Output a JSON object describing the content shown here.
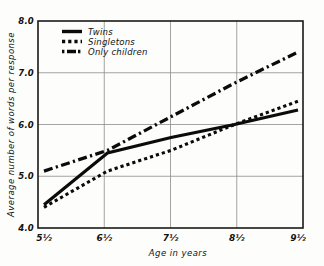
{
  "chart_data": {
    "type": "line",
    "title": "",
    "xlabel": "Age in years",
    "ylabel": "Average number of words per response",
    "x": [
      "5½",
      "6½",
      "7½",
      "8½",
      "9½"
    ],
    "categories": [
      "5½",
      "6½",
      "7½",
      "8½",
      "9½"
    ],
    "xlim": [
      5.5,
      9.5
    ],
    "ylim": [
      4.0,
      8.0
    ],
    "yticks": [
      "4.0",
      "5.0",
      "6.0",
      "7.0",
      "8.0"
    ],
    "ytick_values": [
      4.0,
      5.0,
      6.0,
      7.0,
      8.0
    ],
    "grid": true,
    "legend_position": "top-left-inside",
    "series": [
      {
        "name": "Twins",
        "style": "solid",
        "values": [
          4.45,
          5.45,
          5.75,
          6.0,
          6.28
        ]
      },
      {
        "name": "Singletons",
        "style": "dotted",
        "values": [
          4.4,
          5.1,
          5.5,
          6.0,
          6.45
        ]
      },
      {
        "name": "Only children",
        "style": "dash-dot",
        "values": [
          5.1,
          5.5,
          6.15,
          6.8,
          7.4
        ]
      }
    ]
  },
  "legend": {
    "items": [
      {
        "label": "Twins",
        "swatch": "solid-line-swatch"
      },
      {
        "label": "Singletons",
        "swatch": "dotted-line-swatch"
      },
      {
        "label": "Only children",
        "swatch": "dash-dot-line-swatch"
      }
    ]
  },
  "axes": {
    "y_title": "Average number of words per response",
    "x_title": "Age in years",
    "y_labels": [
      "8.0",
      "7.0",
      "6.0",
      "5.0",
      "4.0"
    ],
    "x_labels": [
      "5½",
      "6½",
      "7½",
      "8½",
      "9½"
    ]
  }
}
